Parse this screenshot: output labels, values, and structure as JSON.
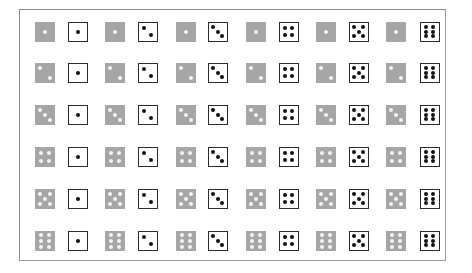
{
  "colors": {
    "gray_die_face": "#a6a6a6",
    "gray_die_pip": "#f4f4f4",
    "white_die_face": "#ffffff",
    "white_die_pip": "#111111",
    "frame_border": "#8a8a8a"
  },
  "grid": {
    "rows": [
      {
        "gray_value": 1,
        "pairs": [
          {
            "gray": 1,
            "white": 1
          },
          {
            "gray": 1,
            "white": 2
          },
          {
            "gray": 1,
            "white": 3
          },
          {
            "gray": 1,
            "white": 4
          },
          {
            "gray": 1,
            "white": 5
          },
          {
            "gray": 1,
            "white": 6
          }
        ]
      },
      {
        "gray_value": 2,
        "pairs": [
          {
            "gray": 2,
            "white": 1
          },
          {
            "gray": 2,
            "white": 2
          },
          {
            "gray": 2,
            "white": 3
          },
          {
            "gray": 2,
            "white": 4
          },
          {
            "gray": 2,
            "white": 5
          },
          {
            "gray": 2,
            "white": 6
          }
        ]
      },
      {
        "gray_value": 3,
        "pairs": [
          {
            "gray": 3,
            "white": 1
          },
          {
            "gray": 3,
            "white": 2
          },
          {
            "gray": 3,
            "white": 3
          },
          {
            "gray": 3,
            "white": 4
          },
          {
            "gray": 3,
            "white": 5
          },
          {
            "gray": 3,
            "white": 6
          }
        ]
      },
      {
        "gray_value": 4,
        "pairs": [
          {
            "gray": 4,
            "white": 1
          },
          {
            "gray": 4,
            "white": 2
          },
          {
            "gray": 4,
            "white": 3
          },
          {
            "gray": 4,
            "white": 4
          },
          {
            "gray": 4,
            "white": 5
          },
          {
            "gray": 4,
            "white": 6
          }
        ]
      },
      {
        "gray_value": 5,
        "pairs": [
          {
            "gray": 5,
            "white": 1
          },
          {
            "gray": 5,
            "white": 2
          },
          {
            "gray": 5,
            "white": 3
          },
          {
            "gray": 5,
            "white": 4
          },
          {
            "gray": 5,
            "white": 5
          },
          {
            "gray": 5,
            "white": 6
          }
        ]
      },
      {
        "gray_value": 6,
        "pairs": [
          {
            "gray": 6,
            "white": 1
          },
          {
            "gray": 6,
            "white": 2
          },
          {
            "gray": 6,
            "white": 3
          },
          {
            "gray": 6,
            "white": 4
          },
          {
            "gray": 6,
            "white": 5
          },
          {
            "gray": 6,
            "white": 6
          }
        ]
      }
    ]
  }
}
